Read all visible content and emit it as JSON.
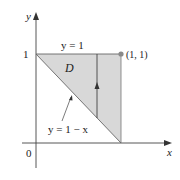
{
  "diagram": {
    "type": "region-of-integration",
    "region_label": "D",
    "axes": {
      "x_label": "x",
      "y_label": "y",
      "origin_label": "0",
      "y_tick_label": "1"
    },
    "curves": {
      "top_line_label": "y = 1",
      "diagonal_label": "y = 1 − x"
    },
    "point_label": "(1, 1)",
    "colors": {
      "region_fill": "#d6d6d6",
      "line": "#555555",
      "axis": "#444444",
      "point": "#888888"
    }
  }
}
